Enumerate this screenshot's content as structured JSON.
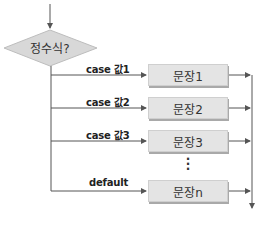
{
  "diagram": {
    "type": "switch-case flowchart",
    "decision": {
      "label": "정수식?"
    },
    "branches": [
      {
        "label": "case 값1",
        "statement": "문장1"
      },
      {
        "label": "case 값2",
        "statement": "문장2"
      },
      {
        "label": "case 값3",
        "statement": "문장3"
      },
      {
        "label": "default",
        "statement": "문장n"
      }
    ],
    "ellipsis": "⋮",
    "colors": {
      "box_fill": "#e4e4e4",
      "box_shadow": "#a9a9a9",
      "line": "#555555",
      "diamond_fill": "#d8d8d8"
    }
  }
}
